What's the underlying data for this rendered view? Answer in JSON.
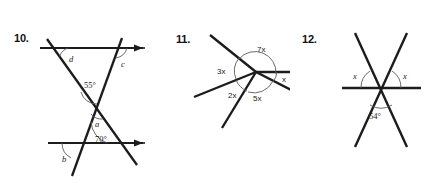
{
  "page": {
    "kind": "geometry-worksheet",
    "background_color": "#ffffff",
    "ink_color": "#1c1c1c",
    "arc_color": "#5a5a5a"
  },
  "problems": [
    {
      "number": "10.",
      "type": "two-parallel-lines-with-two-transversals",
      "labels": {
        "d": "d",
        "c": "c",
        "angle_55": "55°",
        "a": "a",
        "angle_70": "70°",
        "b": "b"
      },
      "known_angles": [
        "55°",
        "70°"
      ],
      "unknown_angles": [
        "a",
        "b",
        "c",
        "d"
      ],
      "arrows": "both horizontal lines point right"
    },
    {
      "number": "11.",
      "type": "five-rays-from-common-vertex",
      "labels": {
        "seven_x": "7x",
        "three_x": "3x",
        "two_x": "2x",
        "five_x": "5x",
        "x": "x"
      },
      "expressions": [
        "7x",
        "3x",
        "2x",
        "5x",
        "x"
      ],
      "sum_degrees": 360
    },
    {
      "number": "12.",
      "type": "two-lines-crossing-a-horizontal-line",
      "labels": {
        "x_left": "x",
        "x_right": "x",
        "angle_54": "54°"
      },
      "known_angles": [
        "54°"
      ],
      "unknown_angles": [
        "x",
        "x"
      ]
    }
  ]
}
